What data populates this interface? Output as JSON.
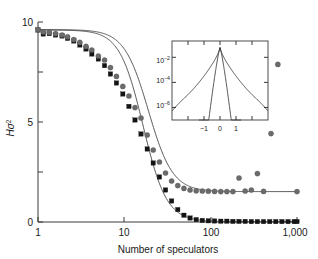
{
  "chart_data": {
    "type": "scatter",
    "title": "",
    "xlabel": "Number of speculators",
    "ylabel": "Hσ²",
    "xscale": "log",
    "yscale": "linear",
    "xlim": [
      1,
      1000
    ],
    "ylim": [
      0,
      10
    ],
    "grid": false,
    "legend": "none",
    "xticks": [
      {
        "value": 1,
        "label": "1"
      },
      {
        "value": 10,
        "label": "10"
      },
      {
        "value": 100,
        "label": "100"
      },
      {
        "value": 1000,
        "label": "1,000"
      }
    ],
    "yticks": [
      {
        "value": 0,
        "label": "0"
      },
      {
        "value": 2.5,
        "label": ""
      },
      {
        "value": 5,
        "label": "5"
      },
      {
        "value": 7.5,
        "label": ""
      },
      {
        "value": 10,
        "label": "10"
      }
    ],
    "series": [
      {
        "name": "circles",
        "marker": "circle",
        "color": "#6b6b6b",
        "points": [
          [
            1,
            9.62
          ],
          [
            1.15,
            9.5
          ],
          [
            1.35,
            9.48
          ],
          [
            1.6,
            9.42
          ],
          [
            1.9,
            9.35
          ],
          [
            2.2,
            9.26
          ],
          [
            2.6,
            9.12
          ],
          [
            3.05,
            8.98
          ],
          [
            3.6,
            8.78
          ],
          [
            4.2,
            8.6
          ],
          [
            5.0,
            8.3
          ],
          [
            5.9,
            8.1
          ],
          [
            6.9,
            7.72
          ],
          [
            8.1,
            7.28
          ],
          [
            9.6,
            6.78
          ],
          [
            11.3,
            6.3
          ],
          [
            13.3,
            5.72
          ],
          [
            15.6,
            5.2
          ],
          [
            18.4,
            4.35
          ],
          [
            21.6,
            3.6
          ],
          [
            25.5,
            3.0
          ],
          [
            30.0,
            2.45
          ],
          [
            35.3,
            2.05
          ],
          [
            41.6,
            1.82
          ],
          [
            49.0,
            1.68
          ],
          [
            57.7,
            1.6
          ],
          [
            68.0,
            1.56
          ],
          [
            80.0,
            1.55
          ],
          [
            94.0,
            1.54
          ],
          [
            111.0,
            1.53
          ],
          [
            131.0,
            1.52
          ],
          [
            154.0,
            1.52
          ],
          [
            181.0,
            1.52
          ],
          [
            213.0,
            2.2
          ],
          [
            251.0,
            1.55
          ],
          [
            296.0,
            1.6
          ],
          [
            348.0,
            2.42
          ],
          [
            410.0,
            1.53
          ],
          [
            500.0,
            4.42
          ],
          [
            600.0,
            7.88
          ],
          [
            1000.0,
            1.52
          ]
        ]
      },
      {
        "name": "squares",
        "marker": "square",
        "color": "#141414",
        "points": [
          [
            1,
            9.6
          ],
          [
            1.15,
            9.4
          ],
          [
            1.35,
            9.42
          ],
          [
            1.6,
            9.35
          ],
          [
            1.9,
            9.3
          ],
          [
            2.2,
            9.18
          ],
          [
            2.6,
            9.05
          ],
          [
            3.05,
            8.85
          ],
          [
            3.6,
            8.65
          ],
          [
            4.2,
            8.4
          ],
          [
            5.0,
            8.15
          ],
          [
            5.9,
            7.82
          ],
          [
            6.9,
            7.4
          ],
          [
            8.1,
            6.95
          ],
          [
            9.6,
            6.4
          ],
          [
            11.3,
            5.78
          ],
          [
            13.3,
            5.1
          ],
          [
            15.6,
            4.4
          ],
          [
            18.4,
            3.65
          ],
          [
            21.6,
            2.95
          ],
          [
            25.5,
            2.25
          ],
          [
            30.0,
            1.6
          ],
          [
            35.3,
            1.05
          ],
          [
            41.6,
            0.62
          ],
          [
            49.0,
            0.34
          ],
          [
            57.7,
            0.2
          ],
          [
            68.0,
            0.12
          ],
          [
            80.0,
            0.08
          ],
          [
            94.0,
            0.06
          ],
          [
            111.0,
            0.05
          ],
          [
            131.0,
            0.04
          ],
          [
            154.0,
            0.04
          ],
          [
            181.0,
            0.03
          ],
          [
            213.0,
            0.03
          ],
          [
            251.0,
            0.03
          ],
          [
            296.0,
            0.02
          ],
          [
            348.0,
            0.02
          ],
          [
            410.0,
            0.02
          ],
          [
            483.0,
            0.02
          ],
          [
            568.0,
            0.02
          ],
          [
            669.0,
            0.02
          ],
          [
            788.0,
            0.02
          ],
          [
            928.0,
            0.02
          ],
          [
            1000.0,
            0.02
          ]
        ]
      }
    ],
    "fit_curves": [
      {
        "name": "circles-fit",
        "plateau": 1.52,
        "top": 9.62,
        "midpoint": 19.0,
        "steepness": 3.1
      },
      {
        "name": "squares-fit",
        "plateau": 0.02,
        "top": 9.6,
        "midpoint": 16.5,
        "steepness": 3.2
      }
    ],
    "inset": {
      "type": "line",
      "xlabel": "",
      "ylabel": "",
      "xscale": "linear",
      "yscale": "log",
      "xlim": [
        -1.5,
        1.5
      ],
      "ylim": [
        1e-07,
        0.2
      ],
      "xticks": [
        {
          "value": -1,
          "label": "−1"
        },
        {
          "value": 0,
          "label": "0"
        },
        {
          "value": 1,
          "label": "1"
        }
      ],
      "yticks": [
        {
          "value": 0.01,
          "label": "10",
          "exponent": "−2"
        },
        {
          "value": 0.0001,
          "label": "10",
          "exponent": "−4"
        },
        {
          "value": 1e-06,
          "label": "10",
          "exponent": "−6"
        }
      ],
      "curves": [
        {
          "name": "fat-tailed-distribution",
          "description": "broad heavy-tailed peak extending to ±1.5"
        },
        {
          "name": "narrow-distribution",
          "description": "narrow peak truncated near ±0.6"
        }
      ]
    }
  }
}
